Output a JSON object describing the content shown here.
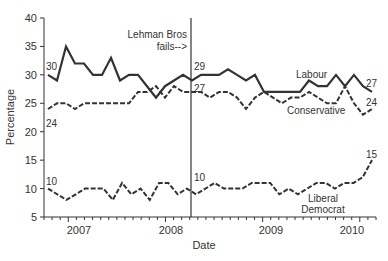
{
  "chart_data": {
    "type": "line",
    "title": "",
    "xlabel": "Date",
    "ylabel": "Percentage",
    "ylim": [
      5,
      40
    ],
    "yticks": [
      5,
      10,
      15,
      20,
      25,
      30,
      35,
      40
    ],
    "xtick_labels": [
      "2007",
      "2008",
      "2009",
      "2010"
    ],
    "grid": false,
    "legend_position": "inline labels",
    "annotation": {
      "text_line1": "Lehman Bros",
      "text_line2": "fails-->",
      "index": 17
    },
    "series": [
      {
        "name": "Labour",
        "label": "Labour",
        "style": "solid",
        "start_label": "30",
        "mid_label": "29",
        "end_label": "27",
        "values": [
          30,
          29,
          35,
          32,
          32,
          30,
          30,
          33,
          29,
          30,
          30,
          28,
          26,
          28,
          29,
          30,
          29,
          30,
          30,
          30,
          31,
          30,
          29,
          30,
          27,
          27,
          27,
          27,
          27,
          29,
          28,
          28,
          30,
          28,
          30,
          28,
          27
        ]
      },
      {
        "name": "Conservative",
        "label": "Conservative",
        "style": "dashed",
        "start_label": "24",
        "mid_label": "27",
        "end_label": "24",
        "values": [
          24,
          25,
          25,
          24,
          25,
          25,
          25,
          25,
          25,
          25,
          27,
          27,
          28,
          26,
          28,
          27,
          27,
          27,
          26,
          27,
          27,
          26,
          24,
          26,
          27,
          26,
          25,
          26,
          26,
          27,
          26,
          25,
          25,
          28,
          25,
          23,
          24
        ]
      },
      {
        "name": "Liberal Democrat",
        "label_line1": "Liberal",
        "label_line2": "Democrat",
        "style": "dashed",
        "start_label": "10",
        "mid_label": "10",
        "end_label": "15",
        "values": [
          10,
          9,
          8,
          9,
          10,
          10,
          10,
          8,
          11,
          9,
          10,
          8,
          11,
          11,
          9,
          10,
          9,
          10,
          11,
          10,
          10,
          10,
          11,
          11,
          11,
          9,
          10,
          9,
          10,
          11,
          11,
          10,
          11,
          11,
          12,
          15
        ]
      }
    ]
  }
}
